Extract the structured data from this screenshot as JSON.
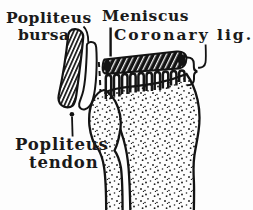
{
  "figure": {
    "background_color": "#fdfdfd",
    "ink_color": "#131313",
    "labels": {
      "popliteus_bursa": {
        "line1": "Popliteus",
        "line2": "bursa"
      },
      "meniscus": "Meniscus",
      "coronary_ligament": "Coronary lig.",
      "popliteus_tendon": {
        "line1": "Popliteus",
        "line2": "tendon"
      }
    }
  }
}
